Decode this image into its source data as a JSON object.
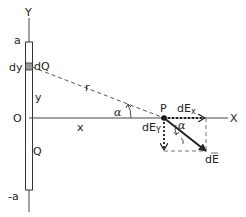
{
  "diagram": {
    "labels": {
      "y_axis": "Y",
      "x_axis": "X",
      "top": "a",
      "bottom": "-a",
      "origin": "O",
      "dy": "dy",
      "dQ": "dQ",
      "y_dist": "y",
      "Q": "Q",
      "r": "r",
      "x_dist": "x",
      "alpha_left": "α",
      "P": "P",
      "dEx": "dEx",
      "dEy": "dEy",
      "alpha_right": "α",
      "dE": "dE"
    },
    "colors": {
      "line": "#333333",
      "dashed": "#555555",
      "element_fill": "#999999"
    }
  }
}
